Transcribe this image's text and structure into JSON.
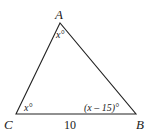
{
  "diagram": {
    "type": "triangle",
    "vertices": {
      "A": {
        "label": "A"
      },
      "B": {
        "label": "B"
      },
      "C": {
        "label": "C"
      }
    },
    "angles": {
      "A": "x°",
      "C": "x°",
      "B": "(x – 15)°"
    },
    "sides": {
      "CB": "10"
    }
  }
}
